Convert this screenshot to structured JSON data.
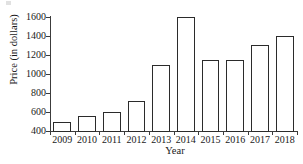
{
  "chart_data": {
    "type": "bar",
    "title": "",
    "subtitle": "",
    "xlabel": "Year",
    "ylabel": "Price (in dollars)",
    "categories": [
      "2009",
      "2010",
      "2011",
      "2012",
      "2013",
      "2014",
      "2015",
      "2016",
      "2017",
      "2018"
    ],
    "values": [
      500,
      560,
      600,
      720,
      1100,
      1600,
      1150,
      1150,
      1310,
      1400
    ],
    "ylim": [
      400,
      1600
    ],
    "yticks": [
      400,
      600,
      800,
      1000,
      1200,
      1400,
      1600
    ],
    "ytick_labels": [
      "400",
      "600",
      "800",
      "1000",
      "1200",
      "1400",
      "1600"
    ],
    "grid": false,
    "legend": false,
    "legend_position": "none",
    "bar_face_color": "#ffffff",
    "bar_edge_color": "#2b2b2b",
    "axis_color": "#3c3c3c",
    "text_color": "#1a1a1a",
    "background_color": "#ffffff",
    "series": [
      {
        "name": "Price",
        "values": [
          500,
          560,
          600,
          720,
          1100,
          1600,
          1150,
          1150,
          1310,
          1400
        ]
      }
    ],
    "annotations": []
  }
}
